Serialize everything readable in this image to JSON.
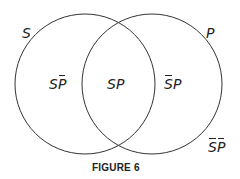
{
  "diagram": {
    "type": "venn",
    "sets": [
      {
        "name": "S",
        "label": "S"
      },
      {
        "name": "P",
        "label": "P"
      }
    ],
    "regions": {
      "s_not_p": {
        "parts": [
          "S",
          "P"
        ],
        "bar": [
          false,
          true
        ]
      },
      "s_and_p": {
        "parts": [
          "S",
          "P"
        ],
        "bar": [
          false,
          false
        ]
      },
      "not_s_p": {
        "parts": [
          "S",
          "P"
        ],
        "bar": [
          true,
          false
        ]
      },
      "not_s_not_p": {
        "parts": [
          "S",
          "P"
        ],
        "bar": [
          true,
          true
        ]
      }
    },
    "caption": "FIGURE 6",
    "stroke_color": "#333333"
  },
  "text": {
    "set_s": "S",
    "set_p": "P",
    "r1a": "S",
    "r1b": "P",
    "r2a": "S",
    "r2b": "P",
    "r3a": "S",
    "r3b": "P",
    "r4a": "S",
    "r4b": "P",
    "caption": "FIGURE 6"
  }
}
